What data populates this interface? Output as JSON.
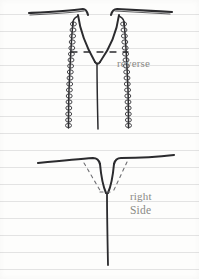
{
  "page": {
    "width": 199,
    "height": 279,
    "paper_color": "#fdfdfc",
    "rule_color": "#e3e3e3",
    "ink_color": "#2b2b2e",
    "label_color": "#8a8a86"
  },
  "ruled_lines": {
    "count": 16,
    "spacing": 17,
    "first_y": 14,
    "y_positions": [
      14,
      31,
      48,
      65,
      82,
      99,
      116,
      133,
      150,
      167,
      184,
      201,
      218,
      235,
      252,
      269
    ]
  },
  "figures": {
    "top": {
      "name": "reverse-view",
      "label": "reverse",
      "label_x": 117,
      "label_y": 57,
      "description": "screw head with wide V notch and two coiled thread lines descending",
      "has_coiled_threads": true,
      "thread_coil_count": 17,
      "dashed_marker_y": 52
    },
    "bottom": {
      "name": "right-side-view",
      "label_line1": "right",
      "label_line2": "Side",
      "label_x": 130,
      "label_y": 190,
      "description": "narrow V point with dashed guide lines and long vertical stem",
      "has_dashed_guides": true,
      "dashed_marker_y": 192
    }
  }
}
